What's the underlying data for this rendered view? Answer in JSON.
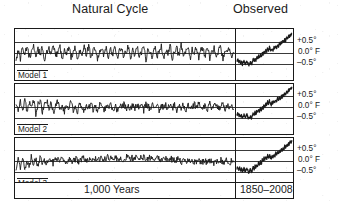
{
  "figure": {
    "headers": {
      "left": "Natural Cycle",
      "right": "Observed"
    },
    "footer": {
      "left": "1,000 Years",
      "right": "1850–2008"
    },
    "panels": [
      {
        "label": "Model 1"
      },
      {
        "label": "Model 2"
      },
      {
        "label": "Model 3"
      }
    ],
    "y_tick_labels": {
      "upper": "+0.5°",
      "middle": "0.0° F",
      "lower": "–0.5°"
    },
    "colors": {
      "ink": "#1a1a1a",
      "grid": "#3a3a3a",
      "paper": "#ffffff"
    }
  },
  "chart_data": {
    "type": "line",
    "title": "",
    "subtitle": "",
    "xlabel": "",
    "ylabel": "Temperature anomaly (°F)",
    "ylim": [
      -1.0,
      1.0
    ],
    "yticks": [
      0.5,
      0.0,
      -0.5
    ],
    "ytick_labels": [
      "+0.5°",
      "0.0° F",
      "–0.5°"
    ],
    "grid": true,
    "legend": "none",
    "panels": [
      {
        "name": "Model 1",
        "segments": [
          {
            "name": "Natural Cycle",
            "x_label": "1,000 Years",
            "x_range": [
              1008,
              2008
            ],
            "description": "High-frequency internal variability oscillating about a flat zero baseline with no long-term trend.",
            "values": [
              -0.3,
              0.12,
              -0.24,
              0.28,
              -0.1,
              0.34,
              -0.22,
              0.06,
              0.3,
              -0.28,
              0.16,
              -0.06,
              0.26,
              -0.32,
              0.1,
              0.22,
              -0.18,
              0.36,
              -0.14,
              0.04,
              0.28,
              -0.26,
              0.18,
              -0.08,
              0.32,
              -0.2,
              0.08,
              0.24,
              -0.3,
              0.14,
              0.02,
              0.3,
              -0.16,
              0.38,
              -0.24,
              0.1,
              0.26,
              -0.28,
              0.06,
              0.2,
              -0.12,
              0.34,
              -0.22,
              0.16,
              -0.04,
              0.28,
              -0.3,
              0.12,
              0.24,
              -0.18,
              0.08,
              0.32,
              -0.26,
              0.14,
              -0.1,
              0.36,
              -0.2,
              0.04,
              0.26,
              -0.32,
              0.18,
              0.1,
              -0.22,
              0.3,
              -0.14,
              0.06,
              0.28,
              -0.24,
              0.16,
              -0.06,
              0.34,
              -0.28,
              0.12,
              0.22,
              -0.18,
              0.4,
              -0.2,
              0.08,
              0.3,
              -0.3,
              0.14,
              -0.02,
              0.26,
              -0.24,
              0.18,
              0.1,
              -0.16,
              0.32,
              -0.26,
              0.06,
              0.24,
              -0.2,
              0.12,
              0.28,
              -0.32,
              0.16,
              -0.08,
              0.3,
              -0.22,
              0.04
            ]
          },
          {
            "name": "Observed",
            "x_label": "1850–2008",
            "x_range": [
              1850,
              2008
            ],
            "description": "Early cool dip near -0.5°F, mid-century plateau, then steep hockey-stick rise to roughly +0.9°F by 2008.",
            "values": [
              -0.38,
              -0.3,
              -0.44,
              -0.34,
              -0.48,
              -0.4,
              -0.52,
              -0.42,
              -0.36,
              -0.5,
              -0.44,
              -0.34,
              -0.46,
              -0.56,
              -0.48,
              -0.4,
              -0.52,
              -0.44,
              -0.3,
              -0.38,
              -0.26,
              -0.34,
              -0.18,
              -0.28,
              -0.12,
              -0.22,
              -0.06,
              -0.18,
              0.02,
              -0.1,
              0.1,
              0.0,
              0.16,
              0.06,
              0.22,
              0.1,
              0.26,
              0.14,
              0.08,
              0.2,
              0.12,
              0.26,
              0.18,
              0.32,
              0.22,
              0.38,
              0.28,
              0.44,
              0.34,
              0.5,
              0.42,
              0.56,
              0.48,
              0.64,
              0.56,
              0.7,
              0.62,
              0.78,
              0.7,
              0.84,
              0.78,
              0.9
            ]
          }
        ]
      },
      {
        "name": "Model 2",
        "segments": [
          {
            "name": "Natural Cycle",
            "x_label": "1,000 Years",
            "x_range": [
              1008,
              2008
            ],
            "description": "Slightly warmer, noisier first third then damped variability about zero; no sustained trend.",
            "values": [
              0.16,
              -0.2,
              0.3,
              -0.1,
              0.36,
              -0.26,
              0.22,
              -0.04,
              0.32,
              -0.3,
              0.14,
              0.26,
              -0.22,
              0.08,
              0.3,
              -0.16,
              0.2,
              -0.28,
              0.12,
              0.24,
              -0.1,
              0.06,
              -0.2,
              0.18,
              -0.06,
              0.22,
              -0.14,
              0.1,
              -0.24,
              0.16,
              0.04,
              -0.18,
              0.12,
              -0.08,
              0.2,
              -0.14,
              0.06,
              -0.2,
              0.14,
              0.02,
              -0.16,
              0.1,
              -0.06,
              0.18,
              -0.12,
              0.04,
              -0.18,
              0.12,
              -0.02,
              0.16,
              -0.1,
              0.06,
              -0.14,
              0.1,
              -0.04,
              0.14,
              -0.12,
              0.08,
              -0.16,
              0.12,
              0.02,
              -0.1,
              0.14,
              -0.06,
              0.1,
              -0.14,
              0.06,
              -0.02,
              0.12,
              -0.1,
              0.16,
              -0.06,
              0.08,
              -0.12,
              0.14,
              -0.04,
              0.1,
              -0.14,
              0.06,
              0.02,
              -0.1,
              0.12,
              -0.06,
              0.16,
              -0.12,
              0.04,
              0.1,
              -0.08,
              0.14,
              -0.16,
              0.06,
              0.12,
              -0.1,
              0.04,
              0.16,
              -0.14,
              0.08,
              -0.04,
              0.12,
              -0.1
            ]
          },
          {
            "name": "Observed",
            "x_label": "1850–2008",
            "x_range": [
              1850,
              2008
            ],
            "description": "Same observational record: cool 19th century, mid-century pause, sharp late-20th-century warming.",
            "values": [
              -0.36,
              -0.28,
              -0.42,
              -0.32,
              -0.46,
              -0.38,
              -0.5,
              -0.4,
              -0.34,
              -0.48,
              -0.42,
              -0.32,
              -0.44,
              -0.54,
              -0.46,
              -0.38,
              -0.5,
              -0.42,
              -0.28,
              -0.36,
              -0.24,
              -0.32,
              -0.16,
              -0.26,
              -0.1,
              -0.2,
              -0.04,
              -0.16,
              0.04,
              -0.08,
              0.12,
              0.02,
              0.18,
              0.08,
              0.24,
              0.12,
              0.28,
              0.16,
              0.1,
              0.22,
              0.14,
              0.28,
              0.2,
              0.34,
              0.24,
              0.4,
              0.3,
              0.46,
              0.36,
              0.52,
              0.44,
              0.58,
              0.5,
              0.66,
              0.58,
              0.72,
              0.64,
              0.8,
              0.72,
              0.86,
              0.8,
              0.92
            ]
          }
        ]
      },
      {
        "name": "Model 3",
        "segments": [
          {
            "name": "Natural Cycle",
            "x_label": "1,000 Years",
            "x_range": [
              1008,
              2008
            ],
            "description": "Cool noisy start, then a long quiet near-zero band with small wiggles; no warming trend.",
            "values": [
              -0.4,
              0.1,
              -0.34,
              0.18,
              -0.44,
              0.06,
              -0.28,
              0.2,
              -0.12,
              0.08,
              -0.22,
              0.14,
              -0.06,
              0.1,
              -0.16,
              0.06,
              0.12,
              -0.1,
              0.08,
              0.14,
              -0.06,
              0.1,
              0.04,
              -0.08,
              0.12,
              0.02,
              -0.06,
              0.1,
              0.04,
              -0.04,
              0.08,
              0.12,
              -0.02,
              0.06,
              0.1,
              0.02,
              0.12,
              0.04,
              0.08,
              0.14,
              0.06,
              0.1,
              0.16,
              0.08,
              0.12,
              0.06,
              0.14,
              0.08,
              0.16,
              0.1,
              0.14,
              0.18,
              0.1,
              0.16,
              0.12,
              0.18,
              0.14,
              0.2,
              0.12,
              0.16,
              0.1,
              0.18,
              0.12,
              0.16,
              0.08,
              0.14,
              0.1,
              0.06,
              0.12,
              0.08,
              0.04,
              0.1,
              0.06,
              0.02,
              0.08,
              0.04,
              -0.02,
              0.06,
              0.02,
              -0.04,
              0.04,
              0.0,
              -0.06,
              0.02,
              -0.02,
              -0.08,
              0.0,
              -0.04,
              -0.1,
              0.02,
              -0.06,
              -0.12,
              0.0,
              -0.08,
              0.04,
              -0.1,
              -0.02,
              0.06,
              -0.14,
              0.02,
              -0.06
            ]
          },
          {
            "name": "Observed",
            "x_label": "1850–2008",
            "x_range": [
              1850,
              2008
            ],
            "description": "Observed record again, ending well above the natural-variability envelope at about +0.9°F.",
            "values": [
              -0.34,
              -0.26,
              -0.4,
              -0.3,
              -0.46,
              -0.36,
              -0.5,
              -0.4,
              -0.32,
              -0.48,
              -0.42,
              -0.3,
              -0.44,
              -0.56,
              -0.46,
              -0.36,
              -0.5,
              -0.42,
              -0.26,
              -0.36,
              -0.22,
              -0.3,
              -0.14,
              -0.24,
              -0.08,
              -0.18,
              -0.02,
              -0.14,
              0.06,
              -0.06,
              0.14,
              0.04,
              0.2,
              0.1,
              0.26,
              0.14,
              0.3,
              0.18,
              0.12,
              0.24,
              0.16,
              0.3,
              0.22,
              0.36,
              0.26,
              0.42,
              0.32,
              0.48,
              0.38,
              0.54,
              0.46,
              0.6,
              0.52,
              0.68,
              0.6,
              0.74,
              0.66,
              0.82,
              0.74,
              0.88,
              0.82,
              0.94
            ]
          }
        ]
      }
    ]
  }
}
